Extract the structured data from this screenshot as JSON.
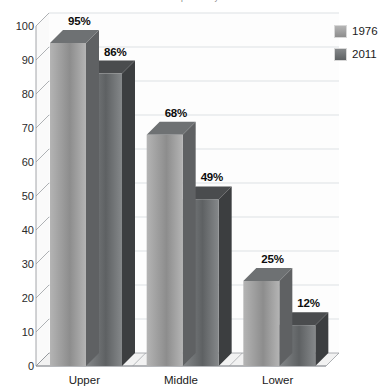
{
  "chart_data": {
    "type": "bar",
    "title": "percent by class",
    "title_truncated": true,
    "xlabel": "",
    "ylabel": "",
    "ylim": [
      0,
      100
    ],
    "ytick_step": 10,
    "yticks": [
      0,
      10,
      20,
      30,
      40,
      50,
      60,
      70,
      80,
      90,
      100
    ],
    "ytick_labels": [
      "0",
      "10",
      "20",
      "30",
      "40",
      "50",
      "60",
      "70",
      "80",
      "90",
      "100"
    ],
    "categories": [
      "Upper",
      "Middle",
      "Lower"
    ],
    "series": [
      {
        "name": "1976",
        "values": [
          95,
          68,
          25
        ],
        "labels": [
          "95%",
          "68%",
          "25%"
        ],
        "color": "#9b9b9b"
      },
      {
        "name": "2011",
        "values": [
          86,
          49,
          12
        ],
        "labels": [
          "86%",
          "49%",
          "12%"
        ],
        "color": "#6f7274"
      }
    ],
    "grid": true,
    "grid_axis": "y",
    "legend_position": "top-right",
    "style": "3d-column",
    "value_label_suffix": "%"
  },
  "legend": {
    "entries": [
      {
        "label": "1976",
        "swatch_name": "legend-swatch-1976"
      },
      {
        "label": "2011",
        "swatch_name": "legend-swatch-2011"
      }
    ]
  },
  "colors": {
    "series_1976_front_top": "#b4b4b4",
    "series_1976_front_bottom": "#8d8d8d",
    "series_1976_side": "#5f6163",
    "series_1976_top": "#6e7173",
    "series_2011_front_top": "#85888a",
    "series_2011_front_bottom": "#5e6163",
    "series_2011_side": "#3c3e40",
    "series_2011_top": "#4a4c4e",
    "gridline": "#cfd4d8",
    "axis": "#8d9195",
    "floor": "#f2f2f2",
    "text": "#1a1a1a"
  }
}
